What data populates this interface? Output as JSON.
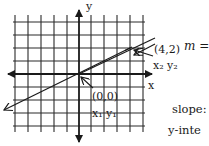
{
  "diagram": {
    "type": "coordinate-plane",
    "axes": {
      "x_label": "x",
      "y_label": "y"
    },
    "grid": {
      "columns": 10,
      "rows": 8,
      "visible": true
    },
    "line": {
      "description": "line through origin with positive slope",
      "points": [
        {
          "label": "(0,0)",
          "subscripts": "x₁ y₁",
          "x": 0,
          "y": 0
        },
        {
          "label": "(4,2)",
          "subscripts": "x₂ y₂",
          "x": 4,
          "y": 2
        }
      ]
    },
    "point_labels": {
      "origin": "(0,0)",
      "origin_sub": "x₁ y₁",
      "p2": "(4,2)",
      "p2_sub": "x₂ y₂"
    }
  },
  "side_text": {
    "formula": "m =",
    "slope_label": "slope:",
    "yint_label": "y-inte"
  },
  "colors": {
    "ink": "#1a1a1a",
    "background": "#ffffff"
  }
}
